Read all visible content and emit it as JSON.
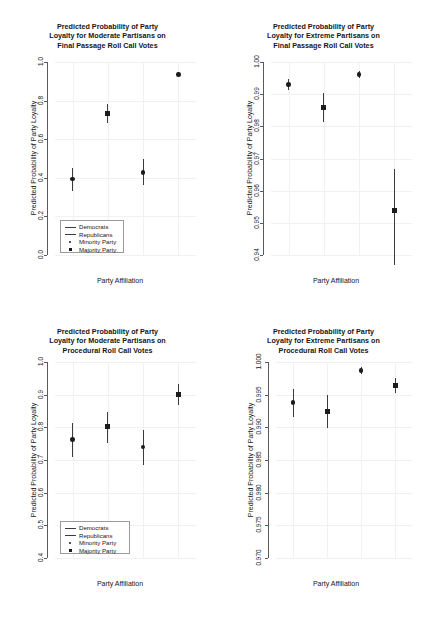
{
  "figure": {
    "width": 431,
    "height": 617,
    "background": "#ffffff",
    "foreground": "#161616",
    "axis_color": "#5a5a5a",
    "grid_color": "#f1f1f1",
    "marker_color": "#1c1c1c",
    "errorbar_color": "#3c3c3c"
  },
  "chart_data": [
    {
      "id": "moderate-final-passage",
      "type": "scatter",
      "title_lines": [
        "Predicted Probability of Party",
        "Loyalty for Moderate Partisans on",
        "Final Passage Roll Call Votes"
      ],
      "title": "Predicted Probability of Party Loyalty for Moderate Partisans on Final Passage Roll Call Votes",
      "xlabel": "Party Affiliation",
      "ylabel": "Predicted Probability of Party Loyalty",
      "ylim": [
        0.0,
        1.0
      ],
      "yticks": [
        0.0,
        0.2,
        0.4,
        0.6,
        0.8,
        1.0
      ],
      "ytick_labels": [
        "0.0",
        "0.2",
        "0.4",
        "0.6",
        "0.8",
        "1.0"
      ],
      "xlim": [
        0.5,
        4.5
      ],
      "grid": true,
      "legend": {
        "position": "bottom-left",
        "entries": [
          {
            "label": "Democrats",
            "key": "line"
          },
          {
            "label": "Republicans",
            "key": "line"
          },
          {
            "label": "Minority Party",
            "key": "circle"
          },
          {
            "label": "Majority Party",
            "key": "square"
          }
        ]
      },
      "points": [
        {
          "x": 1,
          "y": 0.393,
          "lower": 0.333,
          "upper": 0.452,
          "marker": "circle",
          "party": "Democrats",
          "status": "Minority Party"
        },
        {
          "x": 2,
          "y": 0.735,
          "lower": 0.686,
          "upper": 0.783,
          "marker": "square",
          "party": "Democrats",
          "status": "Majority Party"
        },
        {
          "x": 3,
          "y": 0.428,
          "lower": 0.362,
          "upper": 0.497,
          "marker": "circle",
          "party": "Republicans",
          "status": "Minority Party"
        },
        {
          "x": 4,
          "y": 0.934,
          "lower": 0.921,
          "upper": 0.948,
          "marker": "circle",
          "party": "Republicans",
          "status": "Majority Party"
        }
      ]
    },
    {
      "id": "extreme-final-passage",
      "type": "scatter",
      "title_lines": [
        "Predicted Probability of Party",
        "Loyalty for Extreme Partisans on",
        "Final Passage Roll Call Votes"
      ],
      "title": "Predicted Probability of Party Loyalty for Extreme Partisans on Final Passage Roll Call Votes",
      "xlabel": "Party Affiliation",
      "ylabel": "Predicted Probability of Party Loyalty",
      "ylim": [
        0.94,
        1.0
      ],
      "yticks": [
        0.94,
        0.95,
        0.96,
        0.97,
        0.98,
        0.99,
        1.0
      ],
      "ytick_labels": [
        "0.94",
        "0.95",
        "0.96",
        "0.97",
        "0.98",
        "0.99",
        "1.00"
      ],
      "xlim": [
        0.5,
        4.5
      ],
      "grid": true,
      "legend": null,
      "points": [
        {
          "x": 1,
          "y": 0.993,
          "lower": 0.9912,
          "upper": 0.9947,
          "marker": "circle",
          "party": "Democrats",
          "status": "Minority Party"
        },
        {
          "x": 2,
          "y": 0.986,
          "lower": 0.9812,
          "upper": 0.9903,
          "marker": "square",
          "party": "Democrats",
          "status": "Majority Party"
        },
        {
          "x": 3,
          "y": 0.9961,
          "lower": 0.995,
          "upper": 0.9972,
          "marker": "circle",
          "party": "Republicans",
          "status": "Minority Party"
        },
        {
          "x": 4,
          "y": 0.9537,
          "lower": 0.9368,
          "upper": 0.9667,
          "marker": "square",
          "party": "Republicans",
          "status": "Majority Party"
        }
      ]
    },
    {
      "id": "moderate-procedural",
      "type": "scatter",
      "title_lines": [
        "Predicted Probability of Party",
        "Loyalty for Moderate Partisans on",
        "Procedural Roll Call Votes"
      ],
      "title": "Predicted Probability of Party Loyalty for Moderate Partisans on Procedural Roll Call Votes",
      "xlabel": "Party Affiliation",
      "ylabel": "Predicted Probability of Party Loyalty",
      "ylim": [
        0.4,
        1.0
      ],
      "yticks": [
        0.4,
        0.5,
        0.6,
        0.7,
        0.8,
        0.9,
        1.0
      ],
      "ytick_labels": [
        "0.4",
        "0.5",
        "0.6",
        "0.7",
        "0.8",
        "0.9",
        "1.0"
      ],
      "xlim": [
        0.5,
        4.5
      ],
      "grid": true,
      "legend": {
        "position": "bottom-left",
        "entries": [
          {
            "label": "Democrats",
            "key": "line"
          },
          {
            "label": "Republicans",
            "key": "line"
          },
          {
            "label": "Minority Party",
            "key": "circle"
          },
          {
            "label": "Majority Party",
            "key": "square"
          }
        ]
      },
      "points": [
        {
          "x": 1,
          "y": 0.762,
          "lower": 0.709,
          "upper": 0.814,
          "marker": "circle",
          "party": "Democrats",
          "status": "Minority Party"
        },
        {
          "x": 2,
          "y": 0.802,
          "lower": 0.753,
          "upper": 0.848,
          "marker": "square",
          "party": "Democrats",
          "status": "Majority Party"
        },
        {
          "x": 3,
          "y": 0.74,
          "lower": 0.686,
          "upper": 0.793,
          "marker": "circle",
          "party": "Republicans",
          "status": "Minority Party"
        },
        {
          "x": 4,
          "y": 0.901,
          "lower": 0.869,
          "upper": 0.932,
          "marker": "square",
          "party": "Republicans",
          "status": "Majority Party"
        }
      ]
    },
    {
      "id": "extreme-procedural",
      "type": "scatter",
      "title_lines": [
        "Predicted Probability of Party",
        "Loyalty for Extreme Partisans on",
        "Procedural Roll Call Votes"
      ],
      "title": "Predicted Probability of Party Loyalty for Extreme Partisans on Procedural Roll Call Votes",
      "xlabel": "Party Affiliation",
      "ylabel": "Predicted Probability of Party Loyalty",
      "ylim": [
        0.97,
        1.0
      ],
      "yticks": [
        0.97,
        0.975,
        0.98,
        0.985,
        0.99,
        0.995,
        1.0
      ],
      "ytick_labels": [
        "0.970",
        "0.975",
        "0.980",
        "0.985",
        "0.990",
        "0.995",
        "1.000"
      ],
      "xlim": [
        0.5,
        4.5
      ],
      "grid": true,
      "legend": null,
      "points": [
        {
          "x": 1,
          "y": 0.9938,
          "lower": 0.9915,
          "upper": 0.9959,
          "marker": "circle",
          "party": "Democrats",
          "status": "Minority Party"
        },
        {
          "x": 2,
          "y": 0.9925,
          "lower": 0.9899,
          "upper": 0.9949,
          "marker": "square",
          "party": "Democrats",
          "status": "Majority Party"
        },
        {
          "x": 3,
          "y": 0.9987,
          "lower": 0.9982,
          "upper": 0.9993,
          "marker": "circle",
          "party": "Republicans",
          "status": "Minority Party"
        },
        {
          "x": 4,
          "y": 0.9964,
          "lower": 0.9953,
          "upper": 0.9976,
          "marker": "square",
          "party": "Republicans",
          "status": "Majority Party"
        }
      ]
    }
  ]
}
